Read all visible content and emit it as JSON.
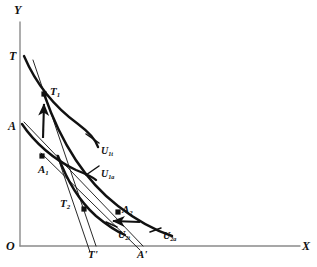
{
  "figure": {
    "background_color": "#ffffff",
    "ink_color": "#111111",
    "axis_color": "#8a8a8a"
  },
  "axes": {
    "y_label": "Y",
    "x_label": "X",
    "origin_label": "O",
    "y_axis": {
      "x": 20,
      "top": 22,
      "bottom": 246
    },
    "x_axis": {
      "y": 246,
      "left": 20,
      "right": 300
    }
  },
  "axis_intercepts": [
    {
      "id": "T",
      "label": "T",
      "x": 10,
      "y": 57,
      "axis": "y"
    },
    {
      "id": "A",
      "label": "A",
      "x": 9,
      "y": 127,
      "axis": "y"
    },
    {
      "id": "T-prime",
      "label": "T'",
      "x": 90,
      "y": 256,
      "axis": "x"
    },
    {
      "id": "A-prime",
      "label": "A'",
      "x": 138,
      "y": 256,
      "axis": "x"
    }
  ],
  "points": [
    {
      "id": "T1",
      "label": "T",
      "sub": "1",
      "px": 44,
      "py": 94,
      "label_x": 50,
      "label_y": 86
    },
    {
      "id": "A1",
      "label": "A",
      "sub": "1",
      "px": 42,
      "py": 156,
      "label_x": 38,
      "label_y": 164
    },
    {
      "id": "T2",
      "label": "T",
      "sub": "2",
      "px": 84,
      "py": 209,
      "label_x": 60,
      "label_y": 198
    },
    {
      "id": "A2",
      "label": "A",
      "sub": "2",
      "px": 118,
      "py": 212,
      "label_x": 122,
      "label_y": 204
    }
  ],
  "curves": [
    {
      "id": "U1t",
      "label": "U",
      "sub": "1t",
      "label_x": 101,
      "label_y": 146,
      "kind": "indifference-curve",
      "path": "M 24 56 C 36 84, 56 108, 78 124 C 90 133, 96 140, 98 147"
    },
    {
      "id": "U1a",
      "label": "U",
      "sub": "1a",
      "label_x": 101,
      "label_y": 169,
      "kind": "indifference-curve",
      "path": "M 22 124 C 34 142, 54 160, 76 170 C 86 174, 93 177, 96 180"
    },
    {
      "id": "U2t",
      "label": "U",
      "sub": "2t",
      "label_x": 118,
      "label_y": 230,
      "kind": "indifference-curve",
      "path": "M 58 156 C 66 178, 78 200, 96 216 C 108 226, 118 232, 125 235"
    },
    {
      "id": "U2a",
      "label": "U",
      "sub": "2a",
      "label_x": 163,
      "label_y": 231,
      "kind": "indifference-curve",
      "path": "M 44 94 C 60 140, 84 180, 118 206 C 140 223, 160 232, 172 236"
    }
  ],
  "budget_lines": [
    {
      "id": "trade-price-line",
      "from_x": 33,
      "from_y": 60,
      "to_x": 96,
      "to_y": 246,
      "kind": "price-line"
    },
    {
      "id": "autarky-price-line",
      "from_x": 24,
      "from_y": 122,
      "to_x": 143,
      "to_y": 246,
      "kind": "price-line"
    },
    {
      "id": "trade-line-lower",
      "from_x": 57,
      "from_y": 155,
      "to_x": 90,
      "to_y": 252,
      "kind": "price-line"
    },
    {
      "id": "autarky-line-lower",
      "from_x": 41,
      "from_y": 153,
      "to_x": 140,
      "to_y": 250,
      "kind": "price-line"
    }
  ],
  "arrows": [
    {
      "id": "arrow-up-to-T1",
      "from_x": 43,
      "from_y": 138,
      "to_x": 44,
      "to_y": 104,
      "direction": "up"
    },
    {
      "id": "arrow-left-to-U2t",
      "from_x": 140,
      "from_y": 222,
      "to_x": 113,
      "to_y": 221,
      "direction": "left"
    }
  ],
  "leader_lines": [
    {
      "id": "leader-U1t",
      "from_x": 99,
      "from_y": 143,
      "to_x": 86,
      "to_y": 134
    },
    {
      "id": "leader-U1a",
      "from_x": 99,
      "from_y": 166,
      "to_x": 86,
      "to_y": 175
    },
    {
      "id": "leader-U2t",
      "from_x": 117,
      "from_y": 227,
      "to_x": 106,
      "to_y": 222
    },
    {
      "id": "leader-U2a",
      "from_x": 161,
      "from_y": 228,
      "to_x": 150,
      "to_y": 232
    }
  ]
}
